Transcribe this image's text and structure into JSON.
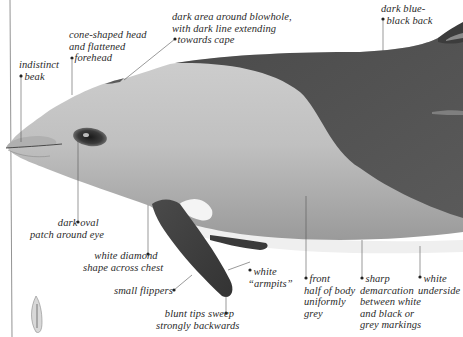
{
  "figure": {
    "colors": {
      "background": "#ffffff",
      "light_grey_body": "#bdbdbd",
      "head_grey": "#c8c8c8",
      "dark_back": "#505050",
      "flipper": "#3e3e3e",
      "white_underside": "#f2f2f2",
      "leader_line": "#555555",
      "eye_patch": "#2b2b2b",
      "text": "#2a2a2a"
    }
  },
  "labels": [
    {
      "id": "indistinct-beak",
      "text": "indistinct\n  beak"
    },
    {
      "id": "cone-shaped-head",
      "text": "cone-shaped head\nand flattened\n  forehead"
    },
    {
      "id": "dark-area-blowhole",
      "text": "dark area around blowhole,\nwith dark line extending\n  towards cape"
    },
    {
      "id": "dark-blue-black-back",
      "text": "dark blue-\n  black back"
    },
    {
      "id": "dark-oval-patch",
      "text": "dark oval  \npatch around eye"
    },
    {
      "id": "white-diamond",
      "text": "white diamond  \nshape across chest"
    },
    {
      "id": "small-flippers",
      "text": "small flippers  "
    },
    {
      "id": "blunt-tips",
      "text": "blunt tips sweep  \nstrongly backwards"
    },
    {
      "id": "white-armpits",
      "text": "  white\n“armpits”"
    },
    {
      "id": "front-half-grey",
      "text": "  front\nhalf of body\nuniformly\ngrey"
    },
    {
      "id": "sharp-demarcation",
      "text": "  sharp\ndemarcation\nbetween white\nand black or\ngrey markings"
    },
    {
      "id": "white-underside",
      "text": "  white\nunderside"
    }
  ]
}
